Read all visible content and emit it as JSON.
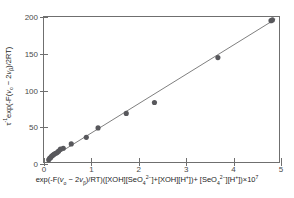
{
  "chart_data": {
    "type": "scatter",
    "title": "",
    "xlabel": "exp(-F(ν₀ − 2νβ)/RT)([XOH][SeO₄²⁻]+[XOH][H⁺])+ [SeO₄²⁻][H⁺])×10⁷",
    "ylabel": "τ⁻¹exp(-F(ν₀ − 2νβ)/2RT)",
    "xlim": [
      0,
      5
    ],
    "ylim": [
      0,
      200
    ],
    "xticks": [
      0,
      1,
      2,
      3,
      4,
      5
    ],
    "yticks": [
      0,
      50,
      100,
      150,
      200
    ],
    "grid": false,
    "legend": "none",
    "marker_color": "#58585c",
    "line_color": "#6f6f6f",
    "axis_color": "#6f6f6f",
    "points": [
      {
        "x": 0.1,
        "y": 3
      },
      {
        "x": 0.12,
        "y": 5
      },
      {
        "x": 0.14,
        "y": 6
      },
      {
        "x": 0.16,
        "y": 8
      },
      {
        "x": 0.18,
        "y": 9
      },
      {
        "x": 0.2,
        "y": 10
      },
      {
        "x": 0.22,
        "y": 11
      },
      {
        "x": 0.25,
        "y": 12
      },
      {
        "x": 0.28,
        "y": 13
      },
      {
        "x": 0.31,
        "y": 15
      },
      {
        "x": 0.35,
        "y": 18
      },
      {
        "x": 0.41,
        "y": 19
      },
      {
        "x": 0.58,
        "y": 25
      },
      {
        "x": 0.9,
        "y": 34
      },
      {
        "x": 1.15,
        "y": 47
      },
      {
        "x": 1.75,
        "y": 67
      },
      {
        "x": 2.35,
        "y": 82
      },
      {
        "x": 3.7,
        "y": 144
      },
      {
        "x": 4.83,
        "y": 195
      },
      {
        "x": 4.86,
        "y": 196
      }
    ],
    "fit_line": {
      "x_start": 0.06,
      "y_start": 2,
      "x_end": 4.92,
      "y_end": 197,
      "slope": 40.1,
      "intercept": -0.4
    }
  }
}
